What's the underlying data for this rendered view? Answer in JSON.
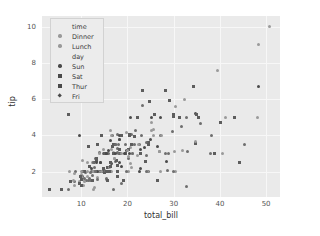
{
  "chart_data": {
    "type": "scatter",
    "title": "",
    "xlabel": "total_bill",
    "ylabel": "tip",
    "xlim": [
      1.5,
      53
    ],
    "ylim": [
      0.6,
      10.6
    ],
    "xticks": [
      "10",
      "20",
      "30",
      "40",
      "50"
    ],
    "xtick_values": [
      10,
      20,
      30,
      40,
      50
    ],
    "yticks": [
      "2",
      "4",
      "6",
      "8",
      "10"
    ],
    "ytick_values": [
      2,
      4,
      6,
      8,
      10
    ],
    "grid": true,
    "grid_color": "#f7f7f7",
    "panel_color": "#eaeaea",
    "point_color": "#6e6e6e",
    "legend_position": "upper left",
    "legend": [
      {
        "type": "title",
        "label": "time",
        "marker": "none"
      },
      {
        "type": "entry",
        "label": "Dinner",
        "marker": "circle",
        "color": "#9a9a9a"
      },
      {
        "type": "entry",
        "label": "Lunch",
        "marker": "circle",
        "color": "#9a9a9a"
      },
      {
        "type": "title",
        "label": "day",
        "marker": "none"
      },
      {
        "type": "entry",
        "label": "Sun",
        "marker": "circle",
        "color": "#4a4a4a"
      },
      {
        "type": "entry",
        "label": "Sat",
        "marker": "square",
        "color": "#4a4a4a"
      },
      {
        "type": "entry",
        "label": "Thur",
        "marker": "square",
        "color": "#4a4a4a"
      },
      {
        "type": "entry",
        "label": "Fri",
        "marker": "diamond",
        "color": "#4a4a4a"
      }
    ],
    "points": [
      [
        16.99,
        1.01
      ],
      [
        10.34,
        1.66
      ],
      [
        21.01,
        3.5
      ],
      [
        23.68,
        3.31
      ],
      [
        24.59,
        3.61
      ],
      [
        25.29,
        4.71
      ],
      [
        8.77,
        2.0
      ],
      [
        26.88,
        3.12
      ],
      [
        15.04,
        1.96
      ],
      [
        14.78,
        3.23
      ],
      [
        10.27,
        1.71
      ],
      [
        35.26,
        5.0
      ],
      [
        15.42,
        1.57
      ],
      [
        18.43,
        3.0
      ],
      [
        14.83,
        3.02
      ],
      [
        21.58,
        3.92
      ],
      [
        10.33,
        1.67
      ],
      [
        16.29,
        3.71
      ],
      [
        16.97,
        3.5
      ],
      [
        20.65,
        3.35
      ],
      [
        17.92,
        4.08
      ],
      [
        20.29,
        2.75
      ],
      [
        15.77,
        2.23
      ],
      [
        39.42,
        7.58
      ],
      [
        19.82,
        3.18
      ],
      [
        17.81,
        2.34
      ],
      [
        13.37,
        2.0
      ],
      [
        12.69,
        2.0
      ],
      [
        21.7,
        4.3
      ],
      [
        19.65,
        3.0
      ],
      [
        9.55,
        1.45
      ],
      [
        18.35,
        2.5
      ],
      [
        15.06,
        3.0
      ],
      [
        20.69,
        2.45
      ],
      [
        17.78,
        3.27
      ],
      [
        24.06,
        3.6
      ],
      [
        16.31,
        2.0
      ],
      [
        16.93,
        3.07
      ],
      [
        18.69,
        2.31
      ],
      [
        31.27,
        5.0
      ],
      [
        16.04,
        2.24
      ],
      [
        17.46,
        2.54
      ],
      [
        13.94,
        3.06
      ],
      [
        9.68,
        1.32
      ],
      [
        30.4,
        5.6
      ],
      [
        18.29,
        3.0
      ],
      [
        22.23,
        5.0
      ],
      [
        32.4,
        6.0
      ],
      [
        28.55,
        2.05
      ],
      [
        18.04,
        3.0
      ],
      [
        12.54,
        2.5
      ],
      [
        10.29,
        2.6
      ],
      [
        34.81,
        5.2
      ],
      [
        9.94,
        1.56
      ],
      [
        25.56,
        4.34
      ],
      [
        19.49,
        3.51
      ],
      [
        38.01,
        3.0
      ],
      [
        26.41,
        1.5
      ],
      [
        11.24,
        1.76
      ],
      [
        48.27,
        6.73
      ],
      [
        20.29,
        3.21
      ],
      [
        13.81,
        2.0
      ],
      [
        11.02,
        1.98
      ],
      [
        18.29,
        3.76
      ],
      [
        17.59,
        2.64
      ],
      [
        20.08,
        3.15
      ],
      [
        16.45,
        2.47
      ],
      [
        3.07,
        1.0
      ],
      [
        20.23,
        2.01
      ],
      [
        15.01,
        2.09
      ],
      [
        12.02,
        1.97
      ],
      [
        17.07,
        3.0
      ],
      [
        26.86,
        3.14
      ],
      [
        25.28,
        5.0
      ],
      [
        14.73,
        2.2
      ],
      [
        10.51,
        1.25
      ],
      [
        17.92,
        3.08
      ],
      [
        27.2,
        4.0
      ],
      [
        22.76,
        3.0
      ],
      [
        17.29,
        2.71
      ],
      [
        19.44,
        3.0
      ],
      [
        16.66,
        3.4
      ],
      [
        10.07,
        1.83
      ],
      [
        32.68,
        5.0
      ],
      [
        15.98,
        2.03
      ],
      [
        34.83,
        5.17
      ],
      [
        13.03,
        2.0
      ],
      [
        18.28,
        4.0
      ],
      [
        24.71,
        5.85
      ],
      [
        21.16,
        3.0
      ],
      [
        28.97,
        3.0
      ],
      [
        22.49,
        3.5
      ],
      [
        5.75,
        1.0
      ],
      [
        16.32,
        4.3
      ],
      [
        22.75,
        3.25
      ],
      [
        40.17,
        4.73
      ],
      [
        27.28,
        4.0
      ],
      [
        12.03,
        1.5
      ],
      [
        21.01,
        3.0
      ],
      [
        12.46,
        1.5
      ],
      [
        11.35,
        2.5
      ],
      [
        15.38,
        3.0
      ],
      [
        44.3,
        2.5
      ],
      [
        22.42,
        3.48
      ],
      [
        20.92,
        4.08
      ],
      [
        15.36,
        1.64
      ],
      [
        20.49,
        4.06
      ],
      [
        25.21,
        4.29
      ],
      [
        18.24,
        3.76
      ],
      [
        14.31,
        4.0
      ],
      [
        14.0,
        3.0
      ],
      [
        7.25,
        1.0
      ],
      [
        38.07,
        4.0
      ],
      [
        23.95,
        2.55
      ],
      [
        25.71,
        4.0
      ],
      [
        17.31,
        3.5
      ],
      [
        29.93,
        5.07
      ],
      [
        10.65,
        1.5
      ],
      [
        12.43,
        1.8
      ],
      [
        24.08,
        2.92
      ],
      [
        11.69,
        2.31
      ],
      [
        13.42,
        1.68
      ],
      [
        14.26,
        2.5
      ],
      [
        15.95,
        2.0
      ],
      [
        12.48,
        2.52
      ],
      [
        29.8,
        4.2
      ],
      [
        8.52,
        1.48
      ],
      [
        14.52,
        2.0
      ],
      [
        11.38,
        2.0
      ],
      [
        22.82,
        2.18
      ],
      [
        19.08,
        1.5
      ],
      [
        20.27,
        2.83
      ],
      [
        11.17,
        1.5
      ],
      [
        12.26,
        2.0
      ],
      [
        18.26,
        3.25
      ],
      [
        8.51,
        1.25
      ],
      [
        10.33,
        2.0
      ],
      [
        14.15,
        2.0
      ],
      [
        16.0,
        2.0
      ],
      [
        13.16,
        2.75
      ],
      [
        17.47,
        3.5
      ],
      [
        34.3,
        6.7
      ],
      [
        41.19,
        5.0
      ],
      [
        27.05,
        5.0
      ],
      [
        16.43,
        2.3
      ],
      [
        8.35,
        1.5
      ],
      [
        18.64,
        1.36
      ],
      [
        11.87,
        1.63
      ],
      [
        9.78,
        1.73
      ],
      [
        7.51,
        2.0
      ],
      [
        14.07,
        2.5
      ],
      [
        13.13,
        2.0
      ],
      [
        17.26,
        2.74
      ],
      [
        24.55,
        2.0
      ],
      [
        19.77,
        2.0
      ],
      [
        29.85,
        5.14
      ],
      [
        48.17,
        5.0
      ],
      [
        25.0,
        3.75
      ],
      [
        13.39,
        2.61
      ],
      [
        16.49,
        2.0
      ],
      [
        21.5,
        3.5
      ],
      [
        12.66,
        2.5
      ],
      [
        16.21,
        2.0
      ],
      [
        13.81,
        2.0
      ],
      [
        17.51,
        3.0
      ],
      [
        24.52,
        3.48
      ],
      [
        20.76,
        2.24
      ],
      [
        31.71,
        4.5
      ],
      [
        10.59,
        1.61
      ],
      [
        10.63,
        2.0
      ],
      [
        50.81,
        10.0
      ],
      [
        15.81,
        3.16
      ],
      [
        7.25,
        5.15
      ],
      [
        31.85,
        3.18
      ],
      [
        16.82,
        4.0
      ],
      [
        32.9,
        3.11
      ],
      [
        17.89,
        2.0
      ],
      [
        14.48,
        2.0
      ],
      [
        9.6,
        4.0
      ],
      [
        34.63,
        3.55
      ],
      [
        34.65,
        3.68
      ],
      [
        23.33,
        5.65
      ],
      [
        45.35,
        3.5
      ],
      [
        23.17,
        6.5
      ],
      [
        40.55,
        3.0
      ],
      [
        20.69,
        5.0
      ],
      [
        20.9,
        3.5
      ],
      [
        30.46,
        2.0
      ],
      [
        18.15,
        3.5
      ],
      [
        23.1,
        4.0
      ],
      [
        15.69,
        1.5
      ],
      [
        19.81,
        4.19
      ],
      [
        28.44,
        2.56
      ],
      [
        15.48,
        2.02
      ],
      [
        16.58,
        4.0
      ],
      [
        7.56,
        1.44
      ],
      [
        10.34,
        2.0
      ],
      [
        43.11,
        5.0
      ],
      [
        13.0,
        2.0
      ],
      [
        13.51,
        2.0
      ],
      [
        18.71,
        4.0
      ],
      [
        12.74,
        2.01
      ],
      [
        13.0,
        2.0
      ],
      [
        16.4,
        2.5
      ],
      [
        20.53,
        4.0
      ],
      [
        16.47,
        3.23
      ],
      [
        26.59,
        3.41
      ],
      [
        38.73,
        3.0
      ],
      [
        24.27,
        2.03
      ],
      [
        12.76,
        2.23
      ],
      [
        30.06,
        2.0
      ],
      [
        25.89,
        5.16
      ],
      [
        48.33,
        9.0
      ],
      [
        13.27,
        2.5
      ],
      [
        28.17,
        6.5
      ],
      [
        12.9,
        1.1
      ],
      [
        28.15,
        3.0
      ],
      [
        11.59,
        1.5
      ],
      [
        7.74,
        1.44
      ],
      [
        30.14,
        3.09
      ],
      [
        12.16,
        2.2
      ],
      [
        13.42,
        3.48
      ],
      [
        8.58,
        1.92
      ],
      [
        15.98,
        3.0
      ],
      [
        13.42,
        1.58
      ],
      [
        16.27,
        2.5
      ],
      [
        10.09,
        2.0
      ],
      [
        20.45,
        3.0
      ],
      [
        13.28,
        2.72
      ],
      [
        22.12,
        2.88
      ],
      [
        24.01,
        2.0
      ],
      [
        15.69,
        3.0
      ],
      [
        11.61,
        3.39
      ],
      [
        10.77,
        1.47
      ],
      [
        15.53,
        3.0
      ],
      [
        10.07,
        1.25
      ],
      [
        12.6,
        1.0
      ],
      [
        32.83,
        1.17
      ],
      [
        35.83,
        4.67
      ],
      [
        29.03,
        5.92
      ],
      [
        27.18,
        2.0
      ],
      [
        22.67,
        2.0
      ],
      [
        17.82,
        1.75
      ],
      [
        18.78,
        3.0
      ]
    ]
  }
}
